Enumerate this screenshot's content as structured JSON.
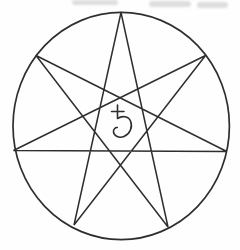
{
  "figure": {
    "name": "heptagram-in-circle-with-saturn-symbol",
    "background_color": "#fefefe",
    "stroke_color": "#2e2e2e",
    "circle": {
      "cx": 121.2,
      "cy": 126,
      "rx": 108.2,
      "ry": 113.6,
      "stroke_width": 1.7
    },
    "star": {
      "type": "heptagram",
      "schlafli_symbol": "7/3",
      "point_count": 7,
      "stroke_width": 1.5,
      "points": [
        {
          "x": 121,
          "y": 12.5
        },
        {
          "x": 205.5,
          "y": 55.5
        },
        {
          "x": 226.8,
          "y": 151.5
        },
        {
          "x": 168,
          "y": 227
        },
        {
          "x": 74,
          "y": 225
        },
        {
          "x": 13.5,
          "y": 150.5
        },
        {
          "x": 36,
          "y": 55.5
        }
      ],
      "edge_order": [
        0,
        3,
        6,
        2,
        5,
        1,
        4,
        0
      ]
    },
    "center_symbol": {
      "name": "saturn-symbol",
      "glyph": "♄",
      "x": 111,
      "y": 104,
      "stroke_width": 1.6
    },
    "scan_artifacts": {
      "color": "#c4c4c4",
      "marks": [
        {
          "x": 72,
          "y": 0,
          "w": 46,
          "h": 5
        },
        {
          "x": 149,
          "y": 1,
          "w": 42,
          "h": 6
        },
        {
          "x": 197,
          "y": 2,
          "w": 31,
          "h": 6
        }
      ]
    }
  }
}
